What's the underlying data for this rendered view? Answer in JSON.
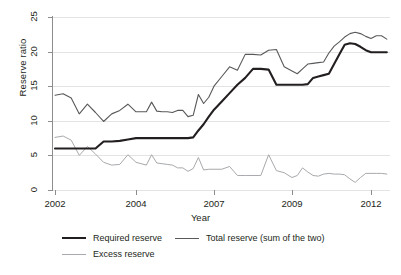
{
  "chart_data": {
    "type": "line",
    "title": "",
    "xlabel": "Year",
    "ylabel": "Reserve ratio",
    "xlim": [
      2002.0,
      2012.6
    ],
    "ylim": [
      0,
      25
    ],
    "yticks": [
      0,
      5,
      10,
      15,
      20,
      25
    ],
    "xticks": [
      2002,
      2004,
      2007,
      2009,
      2012
    ],
    "xtick_labels": [
      "2002",
      "2004",
      "2007",
      "2009",
      "2012"
    ],
    "grid": "horizontal",
    "legend_position": "below",
    "x": [
      2002.0,
      2002.2,
      2002.4,
      2002.6,
      2002.8,
      2003.0,
      2003.2,
      2003.4,
      2003.6,
      2003.8,
      2004.0,
      2004.2,
      2004.4,
      2004.6,
      2004.8,
      2005.0,
      2005.2,
      2005.4,
      2005.6,
      2005.8,
      2006.0,
      2006.2,
      2006.4,
      2006.6,
      2006.8,
      2007.0,
      2007.2,
      2007.4,
      2007.6,
      2007.8,
      2008.0,
      2008.2,
      2008.4,
      2008.6,
      2008.8,
      2009.0,
      2009.2,
      2009.4,
      2009.6,
      2009.8,
      2010.0,
      2010.2,
      2010.4,
      2010.6,
      2010.8,
      2011.0,
      2011.2,
      2011.4,
      2011.6,
      2011.8,
      2012.0,
      2012.2,
      2012.4,
      2012.6
    ],
    "series": [
      {
        "name": "Required reserve",
        "color": "#231f20",
        "width": 2.1,
        "values": [
          6.0,
          6.0,
          6.0,
          6.0,
          6.0,
          6.0,
          7.0,
          7.0,
          7.1,
          7.3,
          7.5,
          7.5,
          7.5,
          7.5,
          7.5,
          7.5,
          7.5,
          7.5,
          7.5,
          7.5,
          7.5,
          7.6,
          8.6,
          9.5,
          10.6,
          11.6,
          12.8,
          14.0,
          15.2,
          16.2,
          17.5,
          17.5,
          17.4,
          15.2,
          15.2,
          15.2,
          15.2,
          15.2,
          15.3,
          16.2,
          16.4,
          16.6,
          16.8,
          18.2,
          19.6,
          21.0,
          21.2,
          21.1,
          20.7,
          20.2,
          19.9,
          19.9,
          19.9,
          19.9
        ]
      },
      {
        "name": "Total reserve (sum of the two)",
        "color": "#58595b",
        "width": 1.1,
        "values": [
          13.7,
          13.9,
          13.3,
          11.0,
          12.4,
          11.2,
          9.9,
          11.0,
          11.5,
          12.4,
          11.3,
          11.3,
          11.3,
          12.7,
          11.4,
          11.3,
          11.3,
          11.2,
          11.5,
          11.5,
          10.6,
          10.8,
          13.8,
          12.5,
          13.4,
          15.0,
          16.4,
          17.8,
          17.3,
          19.6,
          19.6,
          19.5,
          20.2,
          20.3,
          17.8,
          17.2,
          16.8,
          17.5,
          18.2,
          18.3,
          18.4,
          18.5,
          19.8,
          20.8,
          21.4,
          22.1,
          22.6,
          22.8,
          22.6,
          22.2,
          21.9,
          22.3,
          22.3,
          21.8
        ]
      },
      {
        "name": "Excess reserve",
        "color": "#a7a9ac",
        "width": 1.0,
        "values": [
          7.6,
          7.8,
          7.2,
          5.0,
          6.3,
          5.2,
          4.0,
          3.6,
          3.7,
          5.1,
          4.0,
          3.8,
          3.6,
          5.1,
          3.9,
          3.8,
          3.7,
          3.6,
          3.2,
          3.2,
          2.7,
          3.1,
          4.7,
          2.9,
          3.0,
          3.0,
          3.0,
          3.4,
          2.1,
          2.1,
          2.1,
          2.1,
          5.1,
          2.8,
          2.5,
          1.8,
          2.1,
          3.2,
          2.6,
          2.1,
          2.0,
          2.3,
          2.4,
          2.3,
          2.3,
          2.2,
          1.6,
          1.1,
          1.8,
          2.4,
          2.4,
          2.4,
          2.4,
          2.3
        ]
      }
    ],
    "legend": [
      {
        "label": "Required reserve",
        "color": "#231f20",
        "width": 2.1
      },
      {
        "label": "Total reserve (sum of the two)",
        "color": "#58595b",
        "width": 1.1
      },
      {
        "label": "Excess reserve",
        "color": "#a7a9ac",
        "width": 1.0
      }
    ]
  }
}
